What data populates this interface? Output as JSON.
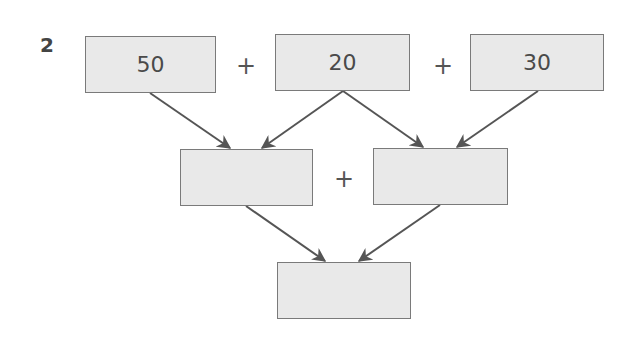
{
  "problem": {
    "number": "2",
    "top_row": [
      {
        "value": "50"
      },
      {
        "value": "20"
      },
      {
        "value": "30"
      }
    ],
    "middle_row": [
      {
        "value": ""
      },
      {
        "value": ""
      }
    ],
    "bottom": {
      "value": ""
    },
    "operators": {
      "top_1": "+",
      "top_2": "+",
      "middle": "+"
    },
    "colors": {
      "box_fill": "#e9e9e9",
      "box_border": "#7a7a7a",
      "arrow": "#555555",
      "text": "#4a4a4a"
    }
  }
}
